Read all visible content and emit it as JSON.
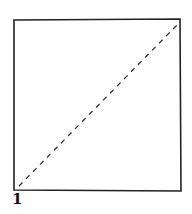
{
  "diagram": {
    "label": "1",
    "square": {
      "x1": 14,
      "y1": 20,
      "x2": 181,
      "y2": 191
    },
    "diagonal": {
      "x1": 19,
      "y1": 186,
      "x2": 178,
      "y2": 24,
      "style": "dashed"
    },
    "stroke_color": "#222222"
  }
}
